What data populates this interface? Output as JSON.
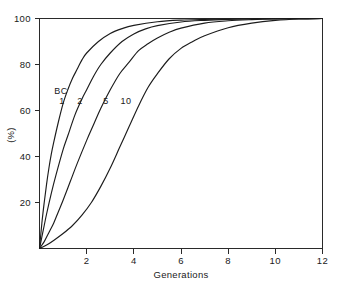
{
  "chart_data": {
    "type": "line",
    "title": "",
    "xlabel": "Generations",
    "ylabel": "(%)",
    "xlim": [
      0,
      12
    ],
    "ylim": [
      0,
      100
    ],
    "xticks": [
      2,
      4,
      6,
      8,
      10,
      12
    ],
    "xtick_labels": [
      "2",
      "4",
      "6",
      "8",
      "10",
      "12"
    ],
    "yticks": [
      20,
      40,
      60,
      80,
      100
    ],
    "ytick_labels": [
      "20",
      "40",
      "60",
      "80",
      "100"
    ],
    "grid": false,
    "legend_position": "inline-curve-labels",
    "legend_prefix": "BC",
    "annotations": [
      {
        "text": "BC",
        "x": 0.95,
        "y": 66.5
      },
      {
        "text": "1",
        "x": 1.0,
        "y": 60.0
      },
      {
        "text": "2",
        "x": 1.72,
        "y": 60.0
      },
      {
        "text": "5",
        "x": 2.85,
        "y": 60.0
      },
      {
        "text": "10",
        "x": 3.65,
        "y": 60.0
      }
    ],
    "series": [
      {
        "name": "1",
        "x": [
          0,
          0.1,
          0.2,
          0.3,
          0.4,
          0.5,
          0.6,
          0.8,
          1.0,
          1.2,
          1.4,
          1.6,
          1.8,
          2.0,
          2.5,
          3.0,
          3.5,
          4.0,
          5.0,
          6.0,
          7.0,
          8.0,
          9.0,
          10.0,
          11.0,
          12.0
        ],
        "y": [
          0,
          11,
          20,
          28,
          35,
          41,
          46,
          55,
          63,
          69,
          74,
          78,
          82,
          85,
          90,
          93.5,
          95.6,
          97.0,
          98.6,
          99.3,
          99.6,
          99.8,
          99.9,
          99.95,
          100,
          100
        ]
      },
      {
        "name": "2",
        "x": [
          0,
          0.1,
          0.2,
          0.3,
          0.5,
          0.7,
          1.0,
          1.2,
          1.5,
          1.8,
          2.0,
          2.3,
          2.6,
          3.0,
          3.5,
          4.0,
          4.5,
          5.0,
          6.0,
          7.0,
          8.0,
          9.0,
          10.0,
          11.0,
          12.0
        ],
        "y": [
          0,
          5,
          10,
          15,
          24,
          32,
          43,
          49,
          58,
          65,
          69,
          75,
          80,
          85,
          90,
          93.3,
          95.5,
          96.9,
          98.5,
          99.2,
          99.6,
          99.8,
          99.9,
          99.95,
          100
        ]
      },
      {
        "name": "5",
        "x": [
          0,
          0.2,
          0.4,
          0.6,
          0.8,
          1.0,
          1.3,
          1.6,
          2.0,
          2.3,
          2.6,
          3.0,
          3.4,
          3.8,
          4.2,
          4.6,
          5.0,
          5.5,
          6.0,
          7.0,
          8.0,
          9.0,
          10.0,
          11.0,
          12.0
        ],
        "y": [
          0,
          3,
          7,
          11,
          16,
          21,
          29,
          37,
          47,
          54,
          61,
          69,
          76,
          81,
          86,
          89,
          91.5,
          94,
          95.8,
          98.0,
          99.0,
          99.5,
          99.8,
          99.95,
          100
        ]
      },
      {
        "name": "10",
        "x": [
          0,
          0.3,
          0.6,
          1.0,
          1.4,
          1.8,
          2.2,
          2.6,
          3.0,
          3.4,
          3.8,
          4.2,
          4.6,
          5.0,
          5.5,
          6.0,
          6.5,
          7.0,
          8.0,
          9.0,
          10.0,
          11.0,
          12.0
        ],
        "y": [
          0,
          1.5,
          3.5,
          6.5,
          10,
          14.5,
          20,
          27,
          35,
          44,
          53,
          62,
          70,
          76,
          82.5,
          87,
          90,
          92.5,
          96,
          98,
          99.2,
          99.8,
          100
        ]
      }
    ]
  }
}
